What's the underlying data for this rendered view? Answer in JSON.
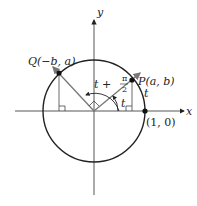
{
  "diagram": {
    "axes": {
      "x_label": "x",
      "y_label": "y"
    },
    "circle": {
      "description": "unit circle"
    },
    "points": {
      "P": {
        "label_name": "P",
        "label_coords": "(a, b)"
      },
      "Q": {
        "label_name": "Q",
        "label_coords": "(−b, a)"
      },
      "one_zero": {
        "label": "(1, 0)"
      }
    },
    "angles": {
      "t_label": "t",
      "arc_t_label": "t",
      "t_plus_pi_over_2": {
        "prefix": "t +",
        "numerator": "π",
        "denominator": "2"
      }
    },
    "colors": {
      "line": "#222222",
      "vector": "#888888",
      "background": "#ffffff"
    }
  }
}
